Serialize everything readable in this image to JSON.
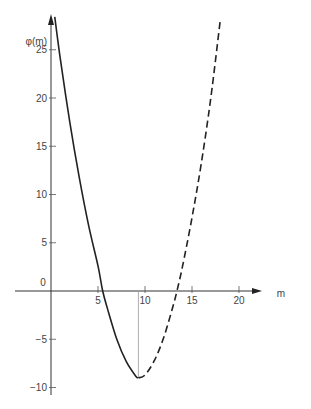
{
  "chart_data": {
    "type": "line",
    "title": "",
    "xlabel": "m",
    "ylabel": "φ(m)",
    "xlim": [
      -4,
      24
    ],
    "ylim": [
      -11,
      28
    ],
    "x_ticks": [
      5,
      10,
      15,
      20
    ],
    "y_ticks": [
      -10,
      -5,
      0,
      5,
      10,
      15,
      20,
      25
    ],
    "origin_label": "0",
    "grid": false,
    "legend": null,
    "series": [
      {
        "name": "φ(m) solid (m ≤ 9.3)",
        "style": "solid",
        "x": [
          0.4,
          1,
          2,
          3,
          4,
          5,
          5.5,
          6,
          7,
          8,
          9,
          9.3
        ],
        "values": [
          28.4,
          24.0,
          17.5,
          11.8,
          6.8,
          2.6,
          0.0,
          -1.8,
          -5.0,
          -7.3,
          -8.8,
          -9.0
        ]
      },
      {
        "name": "φ(m) dashed (m ≥ 9.3)",
        "style": "dashed",
        "x": [
          9.3,
          10,
          11,
          12,
          13,
          13.4,
          14,
          15,
          16,
          17,
          18
        ],
        "values": [
          -9.0,
          -8.7,
          -7.2,
          -4.8,
          -1.5,
          0.0,
          2.6,
          7.6,
          13.3,
          20.0,
          28.0
        ]
      }
    ],
    "annotations": [
      {
        "type": "vertical-line",
        "x": 9.3,
        "from": 0,
        "to": -9.0,
        "note": "thin drop line at minimum"
      }
    ]
  }
}
